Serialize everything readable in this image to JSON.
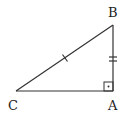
{
  "diagram": {
    "type": "right-triangle",
    "colors": {
      "stroke": "#333333",
      "background": "#ffffff",
      "text": "#222222"
    },
    "vertices": {
      "A": {
        "label": "A",
        "x": 113,
        "y": 91
      },
      "B": {
        "label": "B",
        "x": 113,
        "y": 25
      },
      "C": {
        "label": "C",
        "x": 16,
        "y": 91
      }
    },
    "labels": {
      "A": "A",
      "B": "B",
      "C": "C"
    },
    "marks": {
      "right_angle_at": "A",
      "single_tick_side": "BC",
      "double_tick_side": "AB"
    }
  }
}
